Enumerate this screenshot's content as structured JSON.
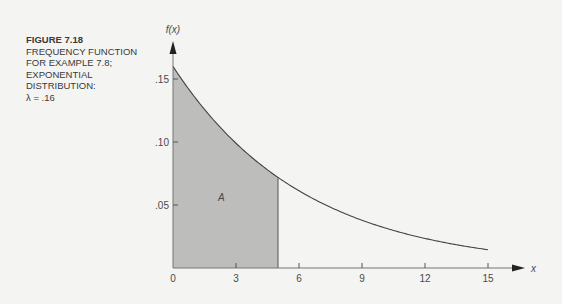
{
  "caption": {
    "figure_number": "FIGURE 7.18",
    "lines": [
      "FREQUENCY FUNCTION",
      "FOR EXAMPLE 7.8;",
      "EXPONENTIAL",
      "DISTRIBUTION:",
      "λ = .16"
    ]
  },
  "chart_data": {
    "type": "area",
    "title": "Frequency function for Example 7.8; exponential distribution: λ = .16",
    "xlabel": "x",
    "ylabel": "f(x)",
    "function": "f(x) = 0.16 * exp(-0.16 x)",
    "lambda": 0.16,
    "xlim": [
      0,
      15
    ],
    "ylim": [
      0,
      0.16
    ],
    "x_ticks": [
      0,
      3,
      6,
      9,
      12,
      15
    ],
    "x_tick_labels": [
      "0",
      "3",
      "6",
      "9",
      "12",
      "15"
    ],
    "y_ticks": [
      0.05,
      0.1,
      0.15
    ],
    "y_tick_labels": [
      ".05",
      ".10",
      ".15"
    ],
    "series": [
      {
        "name": "f(x)",
        "x": [
          0,
          1,
          2,
          3,
          4,
          5,
          6,
          7,
          8,
          9,
          10,
          11,
          12,
          13,
          14,
          15
        ],
        "values": [
          0.16,
          0.136,
          0.116,
          0.099,
          0.084,
          0.072,
          0.061,
          0.052,
          0.044,
          0.038,
          0.032,
          0.028,
          0.023,
          0.02,
          0.017,
          0.015
        ]
      }
    ],
    "shaded_region": {
      "label": "A",
      "x_from": 0,
      "x_to": 5,
      "color": "#bdbdbb"
    },
    "grid": false,
    "legend": "none"
  }
}
